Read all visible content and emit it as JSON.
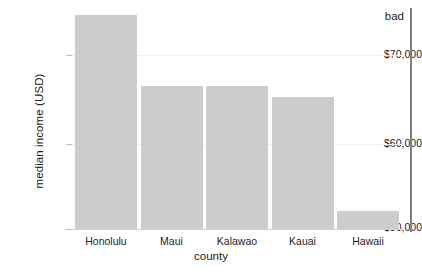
{
  "chart_data": {
    "type": "bar",
    "title": "",
    "subtitle": "",
    "xlabel": "county",
    "ylabel": "median income (USD)",
    "categories": [
      "Honolulu",
      "Maui",
      "Kalawao",
      "Kauai",
      "Hawaii"
    ],
    "values": [
      74600,
      66400,
      66400,
      65200,
      52100
    ],
    "ylim": [
      50000,
      76000
    ],
    "yticks": [
      70000,
      60000,
      50000
    ],
    "ytick_labels": [
      "$70,000",
      "$60,000",
      "$50,000"
    ],
    "grid": "horizontal-only-at-70000-and-60000",
    "legend": "none",
    "bar_color": "#cccccc",
    "gridline_color": "#eceff3",
    "axis_color": "#d2d2d2",
    "text_color": "#1d1d1d",
    "annotations": [
      {
        "label": "bad",
        "type": "vertical-rule-with-text",
        "color": "#808080",
        "position": "right-edge"
      }
    ]
  },
  "axes": {
    "y_title": "median income (USD)",
    "x_title": "county",
    "y_ticks": [
      {
        "label": "$70,000",
        "value": 70000
      },
      {
        "label": "$60,000",
        "value": 60000
      },
      {
        "label": "$50,000",
        "value": 50000
      }
    ],
    "x_ticks": [
      {
        "label": "Honolulu"
      },
      {
        "label": "Maui"
      },
      {
        "label": "Kalawao"
      },
      {
        "label": "Kauai"
      },
      {
        "label": "Hawaii"
      }
    ]
  },
  "annotation": {
    "label": "bad"
  }
}
